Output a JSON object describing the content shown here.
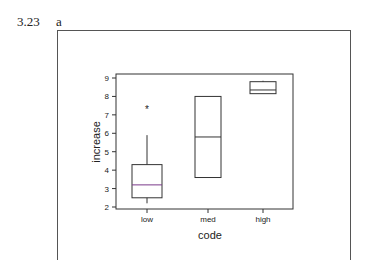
{
  "header": {
    "problem_number": "3.23",
    "part": "a"
  },
  "chart_data": {
    "type": "boxplot",
    "title": "",
    "xlabel": "code",
    "ylabel": "increase",
    "categories": [
      "low",
      "med",
      "high"
    ],
    "ylim": [
      2,
      9
    ],
    "yticks": [
      2,
      3,
      4,
      5,
      6,
      7,
      8,
      9
    ],
    "grid": false,
    "boxes": [
      {
        "category": "low",
        "whisker_low": 2.2,
        "q1": 2.5,
        "median": 3.2,
        "q3": 4.3,
        "whisker_high": 5.9,
        "outliers": [
          7.3
        ]
      },
      {
        "category": "med",
        "whisker_low": 3.6,
        "q1": 3.6,
        "median": 5.8,
        "q3": 8.0,
        "whisker_high": 8.0,
        "outliers": []
      },
      {
        "category": "high",
        "whisker_low": 8.15,
        "q1": 8.15,
        "median": 8.35,
        "q3": 8.8,
        "whisker_high": 8.85,
        "outliers": []
      }
    ],
    "colors": {
      "axis": "#333333",
      "box": "#333333",
      "median_low": "#7a3a8a"
    }
  }
}
